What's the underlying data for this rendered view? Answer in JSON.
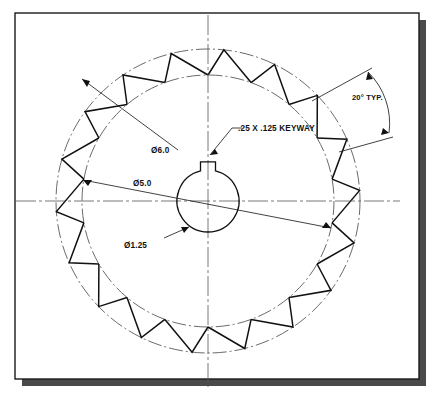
{
  "document": {
    "title": "Ratchet Gear Detail Drawing",
    "sheet_background": "#ffffff",
    "page_background": "#ffffff",
    "border_color": "#1a1a1a",
    "shadow_color": "#4a4a4a",
    "line_color": "#111111",
    "centerline_color": "#555555"
  },
  "drawing": {
    "view_name": "front-view",
    "part_type": "ratchet gear",
    "center": {
      "x": 208,
      "y": 201
    },
    "tooth_count": 18,
    "tooth_pitch_angle_deg": 20,
    "outer_radius_px": 152,
    "root_radius_px": 126,
    "bore_radius_px": 31,
    "keyway": {
      "width_px": 15,
      "height_px": 9
    }
  },
  "labels": {
    "keyway": ".25 X .125 KEYWAY",
    "outer_diameter": "Ø6.0",
    "root_diameter": "Ø5.0",
    "bore_diameter": "Ø1.25",
    "tooth_angle": "20° TYP."
  },
  "dimensions": [
    {
      "name": "outer-diameter",
      "value": "Ø6.0",
      "nominal": 6.0,
      "unit": "in",
      "feature": "outside diameter / tip circle"
    },
    {
      "name": "root-diameter",
      "value": "Ø5.0",
      "nominal": 5.0,
      "unit": "in",
      "feature": "root circle"
    },
    {
      "name": "bore-diameter",
      "value": "Ø1.25",
      "nominal": 1.25,
      "unit": "in",
      "feature": "center bore"
    },
    {
      "name": "keyway-size",
      "value": ".25 X .125 KEYWAY",
      "width": 0.25,
      "depth": 0.125,
      "unit": "in",
      "feature": "keyway slot"
    },
    {
      "name": "tooth-angle",
      "value": "20° TYP.",
      "nominal": 20,
      "unit": "deg",
      "feature": "tooth pitch angle, typical"
    }
  ]
}
